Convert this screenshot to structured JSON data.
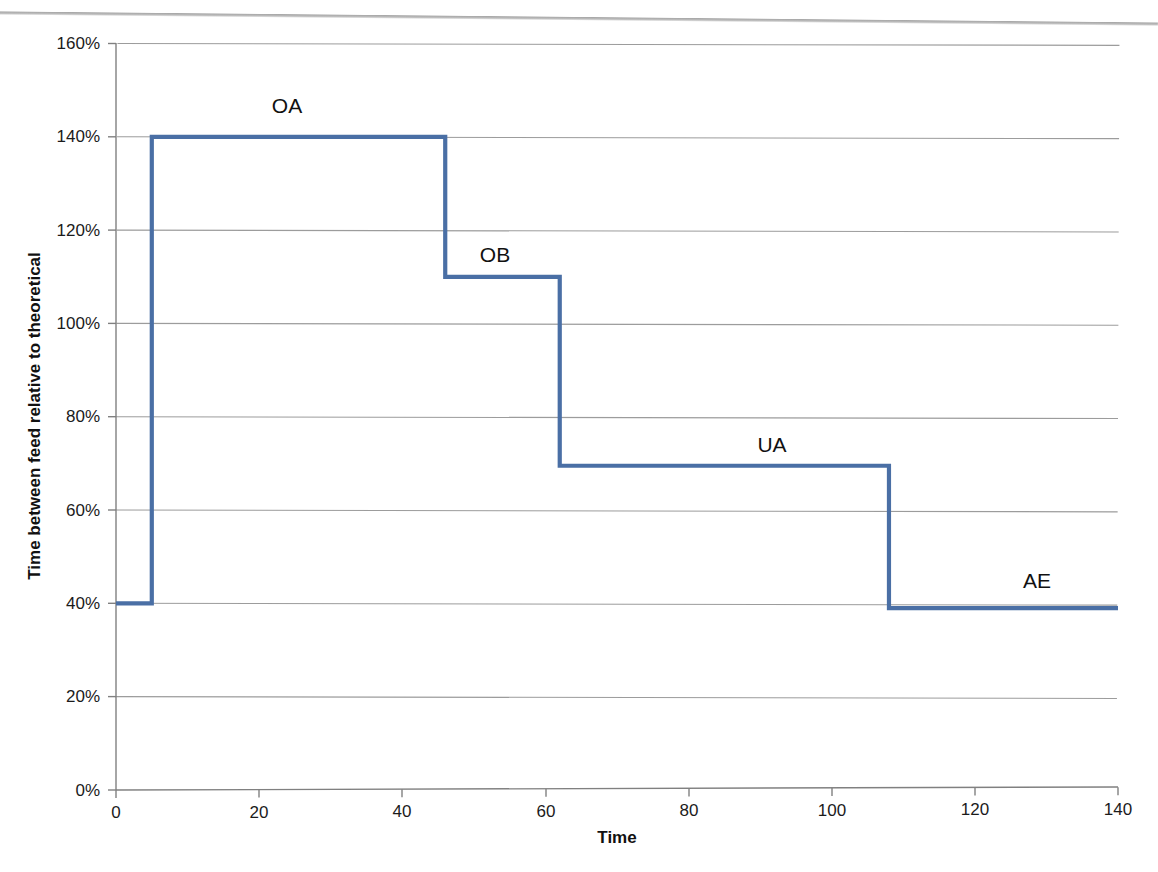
{
  "chart_data": {
    "type": "line",
    "subtype": "step",
    "title": "",
    "xlabel": "Time",
    "ylabel": "Time between feed relative to theoretical",
    "xlim": [
      0,
      140
    ],
    "ylim": [
      0,
      160
    ],
    "xticks": [
      "0",
      "20",
      "40",
      "60",
      "80",
      "100",
      "120",
      "140"
    ],
    "xtick_values": [
      0,
      20,
      40,
      60,
      80,
      100,
      120,
      140
    ],
    "yticks": [
      "0%",
      "20%",
      "40%",
      "60%",
      "80%",
      "100%",
      "120%",
      "140%",
      "160%"
    ],
    "ytick_values": [
      0,
      20,
      40,
      60,
      80,
      100,
      120,
      140,
      160
    ],
    "grid": "horizontal",
    "legend": "none",
    "series": [
      {
        "name": "Time between feed relative to theoretical",
        "color": "#4a6fa5",
        "x": [
          0,
          5,
          5,
          46,
          46,
          62,
          62,
          108,
          108,
          140
        ],
        "values": [
          40,
          40,
          140,
          140,
          110,
          110,
          69.5,
          69.5,
          39,
          39
        ]
      }
    ],
    "steps": [
      {
        "label": "",
        "x_start": 0,
        "x_end": 5,
        "y": 40
      },
      {
        "label": "OA",
        "x_start": 5,
        "x_end": 46,
        "y": 140
      },
      {
        "label": "OB",
        "x_start": 46,
        "x_end": 62,
        "y": 110
      },
      {
        "label": "UA",
        "x_start": 62,
        "x_end": 108,
        "y": 69.5
      },
      {
        "label": "AE",
        "x_start": 108,
        "x_end": 140,
        "y": 39
      }
    ],
    "annotations": [
      {
        "text": "OA",
        "x": 22,
        "y": 150
      },
      {
        "text": "OB",
        "x": 52,
        "y": 118
      },
      {
        "text": "UA",
        "x": 90,
        "y": 79
      },
      {
        "text": "AE",
        "x": 126,
        "y": 49
      }
    ]
  },
  "axes": {
    "y_title": "Time between feed relative to theoretical",
    "x_title": "Time",
    "y_labels": [
      "160%",
      "140%",
      "120%",
      "100%",
      "80%",
      "60%",
      "40%",
      "20%",
      "0%"
    ],
    "x_labels": [
      "0",
      "20",
      "40",
      "60",
      "80",
      "100",
      "120",
      "140"
    ]
  },
  "labels": {
    "oa": "OA",
    "ob": "OB",
    "ua": "UA",
    "ae": "AE"
  },
  "colors": {
    "series_blue": "#4a6fa5",
    "gridline_gray": "#9c9c9c",
    "axis_gray": "#808080",
    "text_black": "#111111",
    "background": "#ffffff"
  }
}
